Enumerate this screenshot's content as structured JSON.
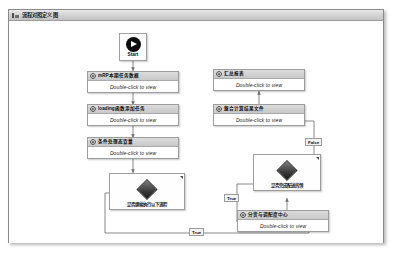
{
  "window": {
    "title": "流程对照定义图",
    "icon": "workflow-icon"
  },
  "canvas": {
    "start": {
      "label": "Start",
      "icon": "play-icon"
    },
    "body_text": "Double-click to view",
    "nodes": [
      {
        "id": "node-mrp-param",
        "header": "mRP本期任务数据",
        "body": "Double-click to view",
        "icon": "gear-icon"
      },
      {
        "id": "node-loading",
        "header": "loading函数添加任务",
        "body": "Double-click to view",
        "icon": "gear-icon"
      },
      {
        "id": "node-condition-check",
        "header": "条件处理态查量",
        "body": "Double-click to view",
        "icon": "gear-icon"
      },
      {
        "id": "node-result-report",
        "header": "汇总报表",
        "body": "Double-click to view",
        "icon": "gear-icon"
      },
      {
        "id": "node-generate-file",
        "header": "整合计算结果文件",
        "body": "Double-click to view",
        "icon": "gear-icon"
      },
      {
        "id": "node-distribute-center",
        "header": "分货与调配度中心",
        "body": "Double-click to view",
        "icon": "gear-icon"
      }
    ],
    "decisions": [
      {
        "id": "decision-left",
        "caption": "是否继续执行以下流程",
        "icon": "diamond-icon"
      },
      {
        "id": "decision-right",
        "caption": "是否完成配送的领",
        "icon": "diamond-icon"
      }
    ],
    "edge_labels": [
      {
        "id": "label-false",
        "text": "False"
      },
      {
        "id": "label-true-mid",
        "text": "True"
      },
      {
        "id": "label-true-bottom",
        "text": "True"
      }
    ]
  },
  "colors": {
    "header_gradient_top": "#dcdcdc",
    "header_gradient_bottom": "#c9c9c9",
    "node_border": "#9d9d9d",
    "edge": "#7a7a7a",
    "canvas_bg": "#ffffff",
    "start_circle": "#0d0d0d"
  }
}
